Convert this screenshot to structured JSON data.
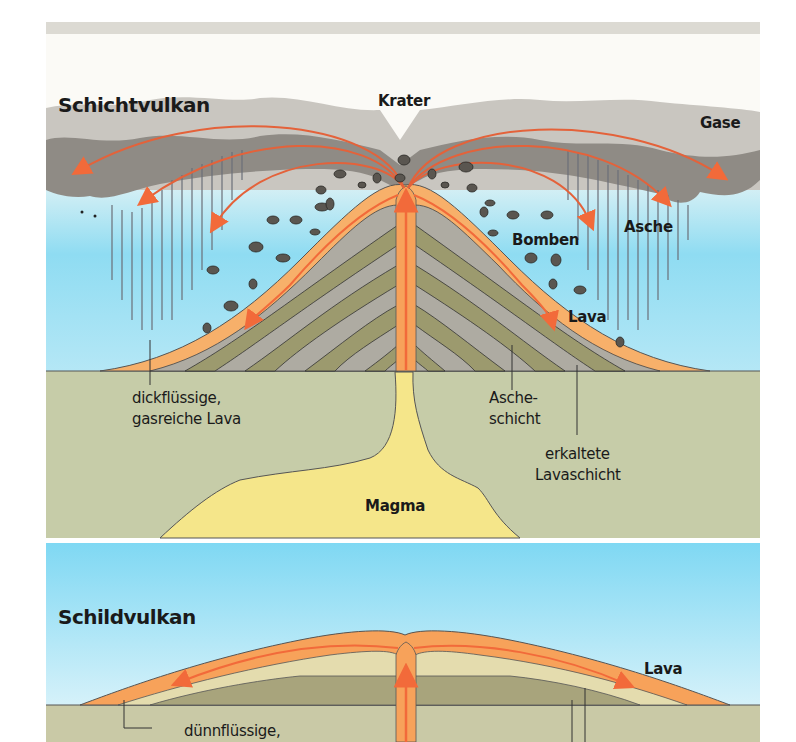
{
  "diagram": {
    "strato": {
      "title": "Schichtvulkan",
      "labels": {
        "crater": "Krater",
        "gases": "Gase",
        "bombs": "Bomben",
        "ash": "Asche",
        "lava": "Lava",
        "lava_type_line1": "dickflüssige,",
        "lava_type_line2": "gasreiche Lava",
        "ash_layer_line1": "Asche-",
        "ash_layer_line2": "schicht",
        "cooled_layer_line1": "erkaltete",
        "cooled_layer_line2": "Lavaschicht",
        "magma": "Magma"
      }
    },
    "shield": {
      "title": "Schildvulkan",
      "labels": {
        "lava": "Lava",
        "lava_type_line1": "dünnflüssige,"
      }
    },
    "colors": {
      "sky": "#8fdcf2",
      "sky_light": "#e6f6fb",
      "cloud_light": "#c9c6c0",
      "cloud_dark": "#8f8b85",
      "lava": "#f7a25a",
      "lava_arrow": "#f26a3a",
      "ground": "#c6cca8",
      "layer_gray": "#aeaba2",
      "layer_olive": "#9c9a6e",
      "magma": "#f5e68a",
      "shield_light": "#e4dcae",
      "shield_dark": "#a8a47c"
    }
  }
}
